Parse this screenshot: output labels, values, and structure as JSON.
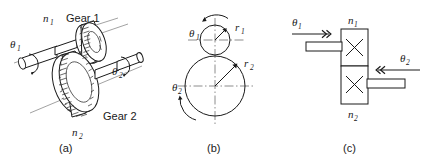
{
  "figure": {
    "background_color": "#ffffff",
    "ink_color": "#1a1a1a",
    "width": 428,
    "height": 163
  },
  "panels": [
    {
      "id": "a",
      "caption": "(a)",
      "description": "Pictorial view of two meshing spur gears on shafts",
      "labels": {
        "theta1": "θ",
        "theta1_sub": "1",
        "theta2": "θ",
        "theta2_sub": "2",
        "n1": "n",
        "n1_sub": "1",
        "n2": "n",
        "n2_sub": "2",
        "gear1": "Gear 1",
        "gear2": "Gear 2"
      }
    },
    {
      "id": "b",
      "caption": "(b)",
      "description": "Pitch-circle diagram with radii r1 and r2 and rotation arrows",
      "labels": {
        "theta1": "θ",
        "theta1_sub": "1",
        "theta2": "θ",
        "theta2_sub": "2",
        "r1": "r",
        "r1_sub": "1",
        "r2": "r",
        "r2_sub": "2"
      },
      "geometry": {
        "small_circle": {
          "cx": 215,
          "cy": 40,
          "r": 15
        },
        "large_circle": {
          "cx": 215,
          "cy": 86,
          "r": 30
        }
      }
    },
    {
      "id": "c",
      "caption": "(c)",
      "description": "Block (schematic) representation of the gear pair with shaft arrows",
      "labels": {
        "theta1": "θ",
        "theta1_sub": "1",
        "theta2": "θ",
        "theta2_sub": "2",
        "n1": "n",
        "n1_sub": "1",
        "n2": "n",
        "n2_sub": "2"
      }
    }
  ]
}
